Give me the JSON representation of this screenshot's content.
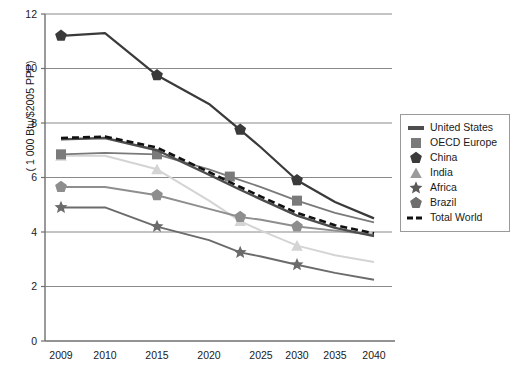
{
  "chart_data": {
    "type": "line",
    "title": "",
    "subtitle": "",
    "xlabel": "",
    "ylabel": "( 1 000 Btu/$2005 PPP)",
    "xlim": [
      2009,
      2040
    ],
    "ylim": [
      0,
      12
    ],
    "yticks": [
      0,
      2,
      4,
      6,
      8,
      10,
      12
    ],
    "ytick_labels": [
      "0",
      "2",
      "4",
      "6",
      "8",
      "10",
      "12"
    ],
    "xticks": [
      2009,
      2010,
      2015,
      2020,
      2025,
      2030,
      2035,
      2040
    ],
    "xtick_labels": [
      "2009",
      "2010",
      "2015",
      "2020",
      "2025",
      "2030",
      "2035",
      "2040"
    ],
    "grid": "horizontal",
    "legend_position": "right-outside",
    "x": [
      2009,
      2010,
      2015,
      2020,
      2023,
      2025,
      2030,
      2035,
      2040
    ],
    "series": [
      {
        "name": "United States",
        "color": "#4d4d4d",
        "marker": "none",
        "dash": "solid",
        "width": 2.4,
        "values": [
          7.4,
          7.45,
          7.0,
          6.1,
          5.55,
          5.2,
          4.6,
          4.15,
          3.85
        ]
      },
      {
        "name": "OECD Europe",
        "color": "#7a7a7a",
        "marker": "square",
        "dash": "solid",
        "width": 1.8,
        "values": [
          6.85,
          6.9,
          6.85,
          6.3,
          5.9,
          5.65,
          5.15,
          4.7,
          4.35
        ],
        "marker_x": [
          2009,
          2015,
          2022,
          2030
        ]
      },
      {
        "name": "China",
        "color": "#3a3a3a",
        "marker": "pentagon",
        "dash": "solid",
        "width": 2.2,
        "values": [
          11.2,
          11.3,
          9.75,
          8.7,
          7.75,
          7.1,
          5.9,
          5.1,
          4.5
        ],
        "marker_x": [
          2009,
          2015,
          2023,
          2030
        ]
      },
      {
        "name": "India",
        "color": "#d4d4d4",
        "marker": "triangle",
        "dash": "solid",
        "width": 2.0,
        "values": [
          6.8,
          6.8,
          6.3,
          5.15,
          4.4,
          4.05,
          3.5,
          3.15,
          2.9
        ],
        "marker_x": [
          2009,
          2015,
          2023,
          2030
        ]
      },
      {
        "name": "Africa",
        "color": "#6b6b6b",
        "marker": "star",
        "dash": "solid",
        "width": 1.9,
        "values": [
          4.9,
          4.9,
          4.2,
          3.7,
          3.25,
          3.1,
          2.8,
          2.5,
          2.25
        ],
        "marker_x": [
          2009,
          2015,
          2023,
          2030
        ]
      },
      {
        "name": "Brazil",
        "color": "#8e8e8e",
        "marker": "pentagon",
        "dash": "solid",
        "width": 1.9,
        "values": [
          5.65,
          5.65,
          5.35,
          4.85,
          4.55,
          4.45,
          4.2,
          4.05,
          3.9
        ],
        "marker_x": [
          2009,
          2015,
          2023,
          2030
        ]
      },
      {
        "name": "Total World",
        "color": "#111111",
        "marker": "none",
        "dash": "dashed",
        "width": 2.6,
        "values": [
          7.45,
          7.5,
          7.1,
          6.2,
          5.65,
          5.3,
          4.7,
          4.25,
          3.95
        ]
      }
    ]
  },
  "legend": {
    "items": [
      {
        "label": "United States",
        "marker": "bar",
        "color": "#4d4d4d"
      },
      {
        "label": "OECD Europe",
        "marker": "square",
        "color": "#7a7a7a"
      },
      {
        "label": "China",
        "marker": "pentagon",
        "color": "#3a3a3a"
      },
      {
        "label": "India",
        "marker": "triangle",
        "color": "#9b9b9b"
      },
      {
        "label": "Africa",
        "marker": "star",
        "color": "#5a5a5a"
      },
      {
        "label": "Brazil",
        "marker": "pentagon",
        "color": "#6e6e6e"
      },
      {
        "label": "Total World",
        "marker": "dashed",
        "color": "#111111"
      }
    ]
  },
  "colors": {
    "axis": "#6f6f6f",
    "grid": "#8a8a8a",
    "background": "#ffffff",
    "text": "#1a1a1a"
  }
}
